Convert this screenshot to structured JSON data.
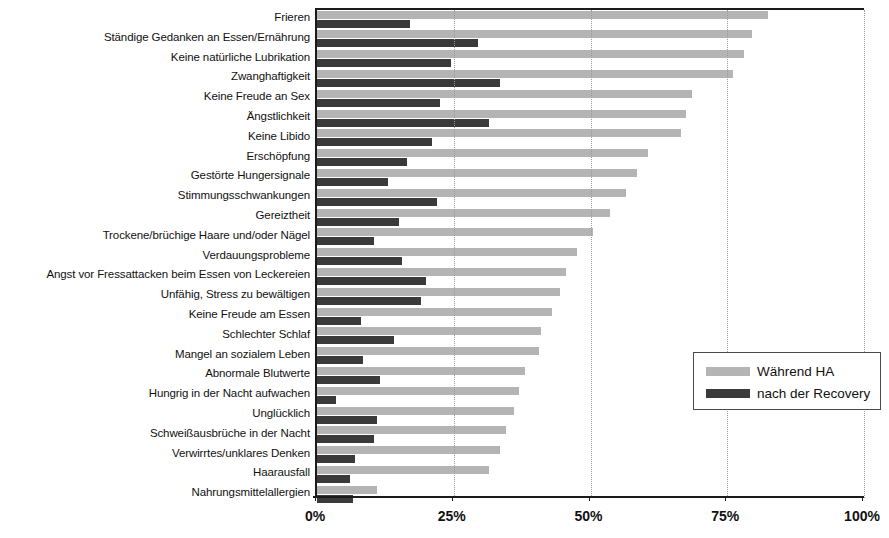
{
  "chart_data": {
    "type": "bar",
    "orientation": "horizontal",
    "title": "",
    "subtitle": "",
    "xlabel": "",
    "ylabel": "",
    "xlim": [
      0,
      100
    ],
    "xticks": [
      0,
      25,
      50,
      75,
      100
    ],
    "xtick_labels": [
      "0%",
      "25%",
      "50%",
      "75%",
      "100%"
    ],
    "grid": true,
    "grid_axis": "x",
    "grid_style": "dotted",
    "legend_position": "lower-right",
    "colors": {
      "series_1": "#b4b4b4",
      "series_2": "#3a3a3a",
      "axis": "#1b1b1b",
      "grid": "#9a9a9a",
      "text": "#111111",
      "background": "#ffffff"
    },
    "categories": [
      "Frieren",
      "Ständige Gedanken an Essen/Ernährung",
      "Keine natürliche Lubrikation",
      "Zwanghaftigkeit",
      "Keine Freude an Sex",
      "Ängstlichkeit",
      "Keine Libido",
      "Erschöpfung",
      "Gestörte Hungersignale",
      "Stimmungsschwankungen",
      "Gereiztheit",
      "Trockene/brüchige Haare und/oder Nägel",
      "Verdauungsprobleme",
      "Angst vor Fressattacken beim Essen von Leckereien",
      "Unfähig, Stress zu bewältigen",
      "Keine Freude am Essen",
      "Schlechter Schlaf",
      "Mangel an sozialem Leben",
      "Abnormale Blutwerte",
      "Hungrig in der Nacht aufwachen",
      "Unglücklich",
      "Schweißausbrüche in der Nacht",
      "Verwirrtes/unklares Denken",
      "Haarausfall",
      "Nahrungsmittelallergien"
    ],
    "series": [
      {
        "name": "Während HA",
        "color": "#b4b4b4",
        "values": [
          82.5,
          79.5,
          78.0,
          76.0,
          68.5,
          67.5,
          66.5,
          60.5,
          58.5,
          56.5,
          53.5,
          50.5,
          47.5,
          45.5,
          44.5,
          43.0,
          41.0,
          40.5,
          38.0,
          37.0,
          36.0,
          34.5,
          33.5,
          31.5,
          11.0
        ]
      },
      {
        "name": "nach der Recovery",
        "color": "#3a3a3a",
        "values": [
          17.0,
          29.5,
          24.5,
          33.5,
          22.5,
          31.5,
          21.0,
          16.5,
          13.0,
          22.0,
          15.0,
          10.5,
          15.5,
          20.0,
          19.0,
          8.0,
          14.0,
          8.5,
          11.5,
          3.5,
          11.0,
          10.5,
          7.0,
          6.0,
          6.5
        ]
      }
    ]
  },
  "legend": {
    "items": [
      {
        "label": "Während HA",
        "color": "#b4b4b4"
      },
      {
        "label": "nach der Recovery",
        "color": "#3a3a3a"
      }
    ]
  }
}
